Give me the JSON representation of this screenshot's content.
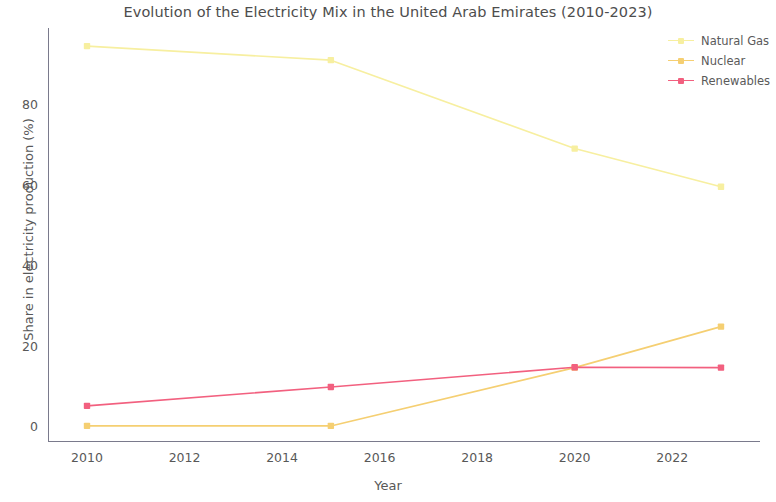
{
  "chart_data": {
    "type": "line",
    "title": "Evolution of the Electricity Mix in the United Arab Emirates (2010-2023)",
    "xlabel": "Year",
    "ylabel": "Share in electricity production (%)",
    "x": [
      2010,
      2015,
      2020,
      2023
    ],
    "xlim": [
      2009.2,
      2023.8
    ],
    "ylim": [
      -4,
      99
    ],
    "xticks": [
      2010,
      2012,
      2014,
      2016,
      2018,
      2020,
      2022
    ],
    "xtick_labels": [
      "2010",
      "2012",
      "2014",
      "2016",
      "2018",
      "2020",
      "2022"
    ],
    "yticks": [
      0,
      20,
      40,
      60,
      80
    ],
    "ytick_labels": [
      "0",
      "20",
      "40",
      "60",
      "80"
    ],
    "grid": false,
    "legend_position": "upper right",
    "series": [
      {
        "name": "Natural Gas",
        "color": "#f7efa0",
        "marker": "square",
        "values": [
          94.5,
          91.0,
          69.0,
          59.5
        ]
      },
      {
        "name": "Nuclear",
        "color": "#f5cf72",
        "marker": "square",
        "values": [
          0.0,
          0.0,
          14.5,
          24.7
        ]
      },
      {
        "name": "Renewables",
        "color": "#f2607f",
        "marker": "square",
        "values": [
          5.0,
          9.7,
          14.6,
          14.5
        ]
      }
    ]
  },
  "legend": {
    "entries": [
      {
        "label": "Natural Gas"
      },
      {
        "label": "Nuclear"
      },
      {
        "label": "Renewables"
      }
    ]
  }
}
